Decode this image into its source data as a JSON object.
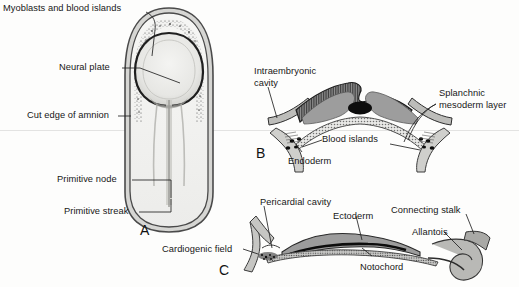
{
  "figure": {
    "background_color": "#fdfdfc",
    "ink_color": "#171717",
    "panels": [
      {
        "letter": "A",
        "name": "dorsal-view-embryonic-disc",
        "labels": [
          "Myoblasts and blood islands",
          "Neural plate",
          "Cut edge of amnion",
          "Primitive node",
          "Primitive streak"
        ]
      },
      {
        "letter": "B",
        "name": "transverse-section",
        "labels": [
          "Intraembryonic cavity",
          "Splanchnic mesoderm layer",
          "Blood islands",
          "Endoderm"
        ]
      },
      {
        "letter": "C",
        "name": "sagittal-section",
        "labels": [
          "Pericardial cavity",
          "Ectoderm",
          "Connecting stalk",
          "Allantois",
          "Notochord",
          "Cardiogenic field"
        ]
      }
    ]
  },
  "panelA": {
    "letter": "A",
    "label_myoblasts": "Myoblasts and blood islands",
    "label_neural_plate": "Neural plate",
    "label_cut_edge": "Cut edge of amnion",
    "label_primitive_node": "Primitive node",
    "label_primitive_streak": "Primitive streak"
  },
  "panelB": {
    "letter": "B",
    "label_intraembryonic_line1": "Intraembryonic",
    "label_intraembryonic_line2": "cavity",
    "label_splanchnic_line1": "Splanchnic",
    "label_splanchnic_line2": "mesoderm layer",
    "label_blood_islands": "Blood islands",
    "label_endoderm": "Endoderm"
  },
  "panelC": {
    "letter": "C",
    "label_pericardial": "Pericardial cavity",
    "label_ectoderm": "Ectoderm",
    "label_connecting_stalk": "Connecting stalk",
    "label_allantois": "Allantois",
    "label_notochord": "Notochord",
    "label_cardiogenic": "Cardiogenic field"
  },
  "colors": {
    "mesoderm_gray": "#9d9d9d",
    "amnion_gray": "#b8b8b8",
    "notochord_black": "#101010",
    "disc_fill": "#efefed",
    "outline": "#3a3a3a"
  }
}
